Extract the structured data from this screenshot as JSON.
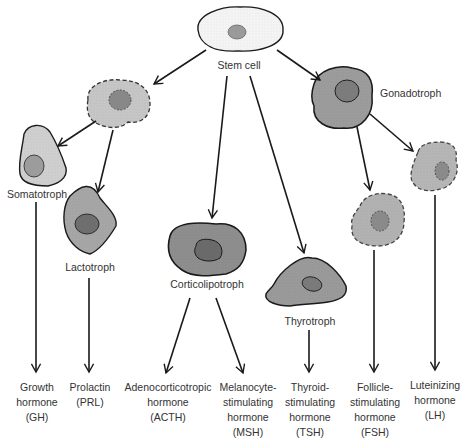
{
  "cells": {
    "stem": {
      "label": "Stem cell"
    },
    "intermediate": {
      "label": ""
    },
    "gonadotroph": {
      "label": "Gonadotroph"
    },
    "somatotroph": {
      "label": "Somatotroph"
    },
    "lactotroph": {
      "label": "Lactotroph"
    },
    "corticolipotroph": {
      "label": "Corticolipotroph"
    },
    "thyrotroph": {
      "label": "Thyrotroph"
    },
    "fsh_cell": {
      "label": ""
    },
    "lh_cell": {
      "label": ""
    }
  },
  "hormones": [
    {
      "id": "gh",
      "text": "Growth\nhormone\n(GH)"
    },
    {
      "id": "prl",
      "text": "Prolactin\n(PRL)"
    },
    {
      "id": "acth",
      "text": "Adenocorticotropic\nhormone\n(ACTH)"
    },
    {
      "id": "msh",
      "text": "Melanocyte-\nstimulating\nhormone\n(MSH)"
    },
    {
      "id": "tsh",
      "text": "Thyroid-\nstimulating\nhormone\n(TSH)"
    },
    {
      "id": "fsh",
      "text": "Follicle-\nstimulating\nhormone\n(FSH)"
    },
    {
      "id": "lh",
      "text": "Luteinizing\nhormone\n(LH)"
    }
  ],
  "colors": {
    "stem_fill": "#f2f2f2",
    "light_fill": "#c4c4c4",
    "medium_fill": "#a8a8a8",
    "dark_fill": "#8a8a8a",
    "nucleus_fill": "#7a7a7a",
    "stroke": "#1a1a1a"
  }
}
